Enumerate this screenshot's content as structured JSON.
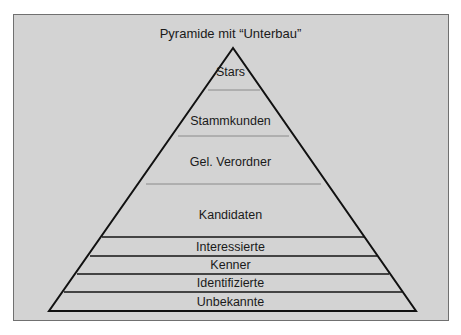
{
  "diagram": {
    "title": "Pyramide mit “Unterbau”",
    "type": "pyramid",
    "colors": {
      "background": "#d3d3d3",
      "outline": "#111111",
      "thin_divider": "#8a8a8a",
      "thick_divider": "#444444"
    },
    "levels": [
      {
        "label": "Stars"
      },
      {
        "label": "Stammkunden"
      },
      {
        "label": "Gel. Verordner"
      },
      {
        "label": "Kandidaten"
      },
      {
        "label": "Interessierte"
      },
      {
        "label": "Kenner"
      },
      {
        "label": "Identifizierte"
      },
      {
        "label": "Unbekannte"
      }
    ]
  }
}
